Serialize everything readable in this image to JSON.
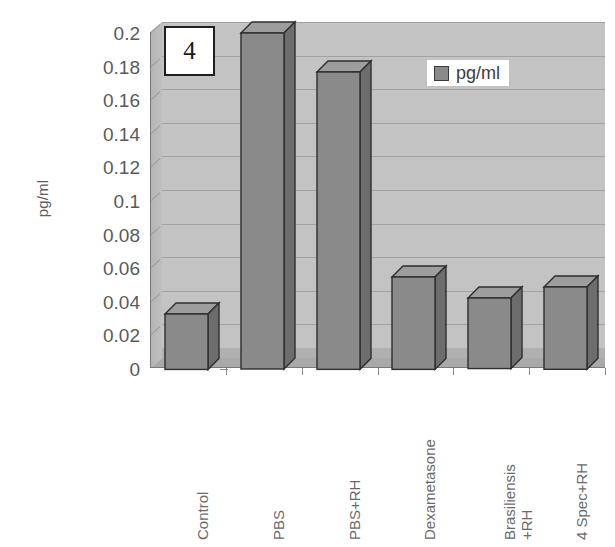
{
  "chart_data": {
    "type": "bar",
    "title": "",
    "panel_label": "4",
    "xlabel": "",
    "ylabel": "pg/ml",
    "ylim": [
      0,
      0.2
    ],
    "ytick_labels": [
      "0.2",
      "0.18",
      "0.16",
      "0.14",
      "0.12",
      "0.1",
      "0.08",
      "0.06",
      "0.04",
      "0.02",
      "0"
    ],
    "ytick_values": [
      0.2,
      0.18,
      0.16,
      0.14,
      0.12,
      0.1,
      0.08,
      0.06,
      0.04,
      0.02,
      0
    ],
    "grid": true,
    "legend_position": "top-right",
    "categories": [
      "Control",
      "PBS",
      "PBS+RH",
      "Dexametasone",
      "Brasiliensis +RH",
      "4 Spec+RH"
    ],
    "category_lines": [
      [
        "Control"
      ],
      [
        "PBS"
      ],
      [
        "PBS+RH"
      ],
      [
        "Dexametasone"
      ],
      [
        "Brasiliensis",
        "+RH"
      ],
      [
        "4 Spec+RH"
      ]
    ],
    "series": [
      {
        "name": "pg/ml",
        "values": [
          0.033,
          0.2,
          0.177,
          0.055,
          0.042,
          0.049
        ],
        "color": "#8a8a8a"
      }
    ]
  },
  "legend": {
    "entries": [
      {
        "label": "pg/ml",
        "color": "#8a8a8a"
      }
    ]
  },
  "colors": {
    "bar_front": "#8a8a8a",
    "bar_side": "#6d6d6d",
    "bar_top": "#9d9d9d",
    "bar_outline": "#2e2e2e",
    "plot_background": "#c3c3c3",
    "floor": "#a9a9a9",
    "gridline": "#9c9c9c",
    "axis_text": "#5a5a5a",
    "label_text": "#6a6a6a"
  }
}
